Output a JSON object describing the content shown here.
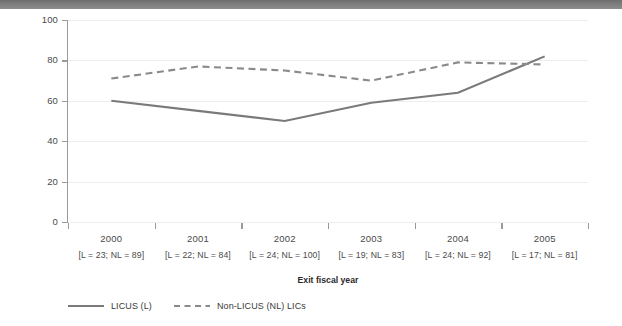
{
  "chart_data": {
    "type": "line",
    "title": "",
    "xlabel": "Exit fiscal year",
    "ylabel": "Percent satisfactory",
    "ylim": [
      0,
      100
    ],
    "ytick_labels": [
      "100",
      "80",
      "60",
      "40",
      "20",
      "0"
    ],
    "yticks": [
      100,
      80,
      60,
      40,
      20,
      0
    ],
    "grid": true,
    "legend_position": "bottom-left",
    "categories": [
      "2000",
      "2001",
      "2002",
      "2003",
      "2004",
      "2005"
    ],
    "category_notes": [
      "[L = 23; NL = 89]",
      "[L = 22; NL = 84]",
      "[L = 24; NL = 100]",
      "[L = 19; NL = 83]",
      "[L = 24; NL = 92]",
      "[L = 17; NL = 81]"
    ],
    "series": [
      {
        "name": "LICUS (L)",
        "style": "solid",
        "color": "#7a7a7a",
        "values": [
          60,
          55,
          50,
          59,
          64,
          82
        ]
      },
      {
        "name": "Non-LICUS (NL) LICs",
        "style": "dashed",
        "color": "#8a8a8a",
        "values": [
          71,
          77,
          75,
          70,
          79,
          78
        ]
      }
    ]
  },
  "legend": {
    "items": [
      {
        "label": "LICUS (L)"
      },
      {
        "label": "Non-LICUS (NL) LICs"
      }
    ]
  },
  "colors": {
    "top_band": "#7c7c7c",
    "axis": "#9a9a9a",
    "gridline": "#ededed",
    "text": "#3a3a3a"
  }
}
